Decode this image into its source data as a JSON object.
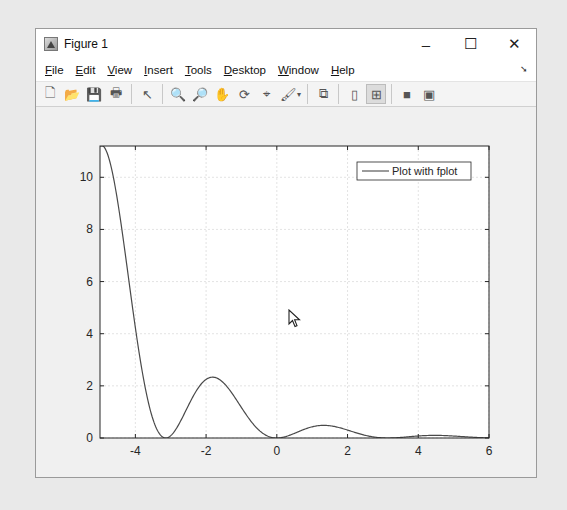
{
  "window": {
    "title": "Figure 1",
    "controls": {
      "minimize": "–",
      "maximize": "☐",
      "close": "✕"
    }
  },
  "menubar": {
    "items": [
      {
        "label": "File",
        "mnemonic": "F",
        "rest": "ile"
      },
      {
        "label": "Edit",
        "mnemonic": "E",
        "rest": "dit"
      },
      {
        "label": "View",
        "mnemonic": "V",
        "rest": "iew"
      },
      {
        "label": "Insert",
        "mnemonic": "I",
        "rest": "nsert"
      },
      {
        "label": "Tools",
        "mnemonic": "T",
        "rest": "ools"
      },
      {
        "label": "Desktop",
        "mnemonic": "D",
        "rest": "esktop"
      },
      {
        "label": "Window",
        "mnemonic": "W",
        "rest": "indow"
      },
      {
        "label": "Help",
        "mnemonic": "H",
        "rest": "elp"
      }
    ],
    "dock_arrow": "➘"
  },
  "toolbar": {
    "buttons": [
      {
        "name": "new-figure",
        "glyph": "🗋"
      },
      {
        "name": "open-file",
        "glyph": "📂"
      },
      {
        "name": "save-figure",
        "glyph": "💾"
      },
      {
        "name": "print-figure",
        "glyph": "🖶"
      },
      {
        "sep": true
      },
      {
        "name": "edit-plot",
        "glyph": "↖"
      },
      {
        "sep": true
      },
      {
        "name": "zoom-in",
        "glyph": "🔍"
      },
      {
        "name": "zoom-out",
        "glyph": "🔎"
      },
      {
        "name": "pan",
        "glyph": "✋"
      },
      {
        "name": "rotate-3d",
        "glyph": "⟳"
      },
      {
        "name": "data-cursor",
        "glyph": "⌖"
      },
      {
        "name": "brush",
        "glyph": "🖌",
        "dropdown": true
      },
      {
        "sep": true
      },
      {
        "name": "link-plot",
        "glyph": "⧉"
      },
      {
        "sep": true
      },
      {
        "name": "hide-plot-tools",
        "glyph": "▯"
      },
      {
        "name": "show-plot-tools",
        "glyph": "⊞",
        "active": true
      },
      {
        "sep": true
      },
      {
        "name": "colorbar",
        "glyph": "■"
      },
      {
        "name": "legend",
        "glyph": "▣"
      }
    ]
  },
  "chart_data": {
    "type": "line",
    "title": "",
    "xlabel": "",
    "ylabel": "",
    "function": "exp(-x/2).*sin(x).^2",
    "xlim": [
      -5,
      6
    ],
    "ylim": [
      0,
      11.2
    ],
    "xticks": [
      -4,
      -2,
      0,
      2,
      4,
      6
    ],
    "yticks": [
      0,
      2,
      4,
      6,
      8,
      10
    ],
    "grid": true,
    "legend": {
      "entries": [
        "Plot with fplot"
      ],
      "position": "northeast"
    },
    "series": [
      {
        "name": "Plot with fplot",
        "color": "#4a4a4a",
        "x": [
          -5,
          -4.75,
          -4.5,
          -4.25,
          -4,
          -3.75,
          -3.5,
          -3.25,
          -3,
          -2.75,
          -2.5,
          -2.25,
          -2,
          -1.75,
          -1.5,
          -1.25,
          -1,
          -0.75,
          -0.5,
          -0.25,
          0,
          0.25,
          0.5,
          0.75,
          1,
          1.25,
          1.5,
          1.75,
          2,
          2.25,
          2.5,
          2.75,
          3,
          3.25,
          3.5,
          3.75,
          4,
          4.25,
          4.5,
          4.75,
          5,
          5.25,
          5.5,
          5.75,
          6
        ],
        "y": [
          11.2,
          10.15,
          8.32,
          6.12,
          4.22,
          2.23,
          0.72,
          0.06,
          0.09,
          0.56,
          1.25,
          1.86,
          2.26,
          2.36,
          2.1,
          1.68,
          1.16,
          0.67,
          0.29,
          0.07,
          0,
          0.05,
          0.18,
          0.35,
          0.43,
          0.48,
          0.47,
          0.4,
          0.3,
          0.19,
          0.1,
          0.04,
          0.004,
          0.002,
          0.02,
          0.05,
          0.08,
          0.1,
          0.1,
          0.09,
          0.08,
          0.05,
          0.03,
          0.01,
          0.004
        ]
      }
    ]
  },
  "plot": {
    "x_tick_labels": [
      "-4",
      "-2",
      "0",
      "2",
      "4",
      "6"
    ],
    "y_tick_labels": [
      "0",
      "2",
      "4",
      "6",
      "8",
      "10"
    ],
    "legend_label": "Plot with fplot"
  }
}
